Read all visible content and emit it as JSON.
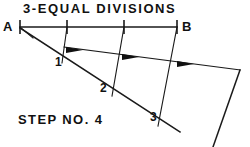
{
  "figure": {
    "title": "3-EQUAL DIVISIONS",
    "step_caption": "STEP NO. 4",
    "endpoint_labels": {
      "left": "A",
      "right": "B"
    },
    "division_numbers": [
      "1",
      "2",
      "3"
    ],
    "stroke_color": "#1a1a1a",
    "background_color": "#ffffff",
    "geometry": {
      "baseline": {
        "x1": 20,
        "y1": 27,
        "x2": 177,
        "y2": 27
      },
      "baseline_ticks_x": [
        20,
        67,
        124,
        177
      ],
      "baseline_tick_half_height": 7,
      "apex": {
        "x": 20,
        "y": 27
      },
      "oblique_line": {
        "x1": 20,
        "y1": 27,
        "x2": 180,
        "y2": 132
      },
      "oblique_points": [
        {
          "label": "1",
          "x": 66,
          "y": 57
        },
        {
          "label": "2",
          "x": 115,
          "y": 89
        },
        {
          "label": "3",
          "x": 163,
          "y": 120
        }
      ],
      "transfer_line": {
        "x1": 66,
        "y1": 48,
        "x2": 240,
        "y2": 70
      },
      "projector_lines": [
        {
          "x1": 67,
          "y1": 27,
          "x2": 62,
          "y2": 62
        },
        {
          "x1": 124,
          "y1": 27,
          "x2": 112,
          "y2": 95
        },
        {
          "x1": 177,
          "y1": 27,
          "x2": 158,
          "y2": 125
        }
      ],
      "right_edge_line": {
        "x1": 240,
        "y1": 70,
        "x2": 213,
        "y2": 147
      },
      "arrow_markers": [
        {
          "x": 74,
          "y": 49,
          "angle": 7
        },
        {
          "x": 130,
          "y": 56,
          "angle": 7
        },
        {
          "x": 185,
          "y": 63,
          "angle": 7
        }
      ]
    },
    "label_positions": {
      "title": {
        "x": 23,
        "y": 3
      },
      "A": {
        "x": 4,
        "y": 20
      },
      "B": {
        "x": 182,
        "y": 20
      },
      "num1": {
        "x": 55,
        "y": 57
      },
      "num2": {
        "x": 100,
        "y": 82
      },
      "num3": {
        "x": 150,
        "y": 111
      },
      "step": {
        "x": 18,
        "y": 113
      }
    }
  }
}
